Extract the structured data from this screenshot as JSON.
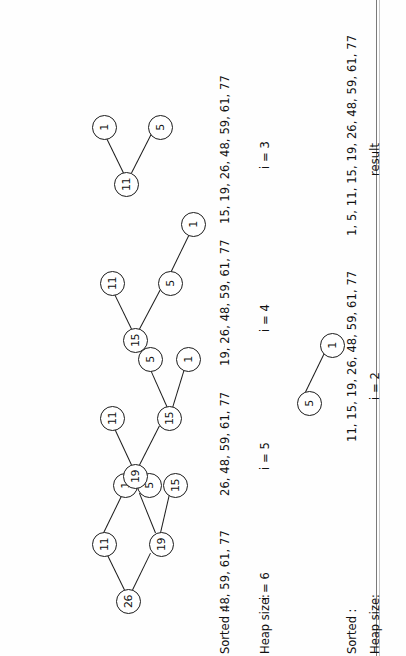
{
  "page": {
    "orientation_degrees": -90,
    "ink_color": "#111111",
    "paper_color": "#ffffff",
    "rule_color": "#7a7a7a"
  },
  "rows": [
    {
      "name": "row-1",
      "row_labels": {
        "sorted_key": "Sorted :",
        "heap_size_key": "Heap size:"
      },
      "steps": [
        {
          "name": "step-i6",
          "iteration_label": "i = 6",
          "sorted_list": "48, 59, 61, 77",
          "nodes": [
            {
              "id": "n0",
              "value": "26"
            },
            {
              "id": "n1",
              "value": "11"
            },
            {
              "id": "n2",
              "value": "19"
            },
            {
              "id": "n3",
              "value": "1"
            },
            {
              "id": "n4",
              "value": "5"
            },
            {
              "id": "n5",
              "value": "15"
            }
          ],
          "edges": [
            {
              "from": "n0",
              "to": "n1"
            },
            {
              "from": "n0",
              "to": "n2"
            },
            {
              "from": "n1",
              "to": "n3"
            },
            {
              "from": "n2",
              "to": "n4"
            },
            {
              "from": "n2",
              "to": "n5"
            }
          ]
        },
        {
          "name": "step-i5",
          "iteration_label": "i = 5",
          "sorted_list": "26, 48, 59, 61, 77",
          "nodes": [
            {
              "id": "n0",
              "value": "19"
            },
            {
              "id": "n1",
              "value": "11"
            },
            {
              "id": "n2",
              "value": "15"
            },
            {
              "id": "n3",
              "value": "5"
            },
            {
              "id": "n4",
              "value": "1"
            }
          ],
          "edges": [
            {
              "from": "n0",
              "to": "n1"
            },
            {
              "from": "n0",
              "to": "n2"
            },
            {
              "from": "n2",
              "to": "n3"
            },
            {
              "from": "n2",
              "to": "n4"
            }
          ]
        },
        {
          "name": "step-i4",
          "iteration_label": "i = 4",
          "sorted_list": "19, 26, 48, 59, 61, 77",
          "nodes": [
            {
              "id": "n0",
              "value": "15"
            },
            {
              "id": "n1",
              "value": "11"
            },
            {
              "id": "n2",
              "value": "5"
            },
            {
              "id": "n3",
              "value": "1"
            }
          ],
          "edges": [
            {
              "from": "n0",
              "to": "n1"
            },
            {
              "from": "n0",
              "to": "n2"
            },
            {
              "from": "n2",
              "to": "n3"
            }
          ]
        },
        {
          "name": "step-i3",
          "iteration_label": "i = 3",
          "sorted_list": "15, 19, 26, 48, 59, 61, 77",
          "nodes": [
            {
              "id": "n0",
              "value": "11"
            },
            {
              "id": "n1",
              "value": "1"
            },
            {
              "id": "n2",
              "value": "5"
            }
          ],
          "edges": [
            {
              "from": "n0",
              "to": "n1"
            },
            {
              "from": "n0",
              "to": "n2"
            }
          ]
        }
      ]
    },
    {
      "name": "row-2",
      "row_labels": {
        "sorted_key": "Sorted :",
        "heap_size_key": "Heap size:"
      },
      "steps": [
        {
          "name": "step-i2",
          "iteration_label": "i = 2",
          "sorted_list": "11, 15, 19, 26, 48, 59, 61, 77",
          "nodes": [
            {
              "id": "n0",
              "value": "5"
            },
            {
              "id": "n1",
              "value": "1"
            }
          ],
          "edges": [
            {
              "from": "n0",
              "to": "n1"
            }
          ]
        },
        {
          "name": "step-result",
          "iteration_label": "result",
          "sorted_list": "1, 5, 11, 15, 19, 26, 48, 59, 61, 77",
          "nodes": [],
          "edges": []
        }
      ]
    }
  ]
}
